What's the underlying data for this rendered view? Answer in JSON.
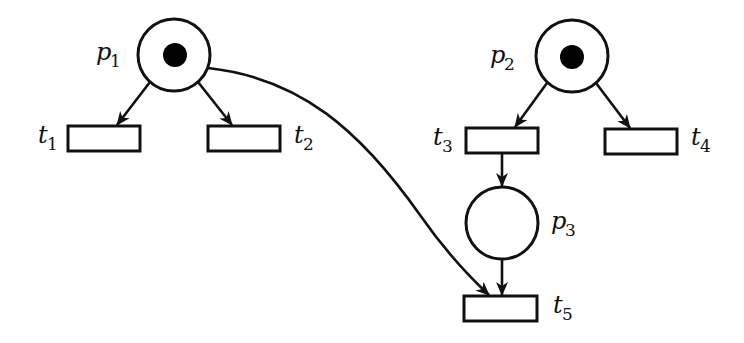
{
  "diagram": {
    "type": "petri-net",
    "colors": {
      "stroke": "#111111",
      "background": "#ffffff",
      "token": "#000000"
    },
    "places": [
      {
        "id": "p1",
        "label": "p",
        "sub": "1",
        "cx": 174,
        "cy": 55,
        "r": 36,
        "tokens": 1
      },
      {
        "id": "p2",
        "label": "p",
        "sub": "2",
        "cx": 572,
        "cy": 56,
        "r": 36,
        "tokens": 1
      },
      {
        "id": "p3",
        "label": "p",
        "sub": "3",
        "cx": 502,
        "cy": 223,
        "r": 36,
        "tokens": 0
      }
    ],
    "transitions": [
      {
        "id": "t1",
        "label": "t",
        "sub": "1",
        "x": 68,
        "y": 126,
        "w": 72,
        "h": 25
      },
      {
        "id": "t2",
        "label": "t",
        "sub": "2",
        "x": 208,
        "y": 126,
        "w": 72,
        "h": 25
      },
      {
        "id": "t3",
        "label": "t",
        "sub": "3",
        "x": 466,
        "y": 128,
        "w": 72,
        "h": 25
      },
      {
        "id": "t4",
        "label": "t",
        "sub": "4",
        "x": 605,
        "y": 129,
        "w": 72,
        "h": 25
      },
      {
        "id": "t5",
        "label": "t",
        "sub": "5",
        "x": 464,
        "y": 296,
        "w": 73,
        "h": 25
      }
    ],
    "arcs": [
      {
        "from": "p1",
        "to": "t1"
      },
      {
        "from": "p1",
        "to": "t2"
      },
      {
        "from": "p2",
        "to": "t3"
      },
      {
        "from": "p2",
        "to": "t4"
      },
      {
        "from": "t3",
        "to": "p3"
      },
      {
        "from": "p3",
        "to": "t5"
      },
      {
        "from": "p1",
        "to": "t5",
        "curved": true
      }
    ],
    "labels": {
      "p1": {
        "main": "p",
        "sub": "1"
      },
      "p2": {
        "main": "p",
        "sub": "2"
      },
      "p3": {
        "main": "p",
        "sub": "3"
      },
      "t1": {
        "main": "t",
        "sub": "1"
      },
      "t2": {
        "main": "t",
        "sub": "2"
      },
      "t3": {
        "main": "t",
        "sub": "3"
      },
      "t4": {
        "main": "t",
        "sub": "4"
      },
      "t5": {
        "main": "t",
        "sub": "5"
      }
    }
  }
}
